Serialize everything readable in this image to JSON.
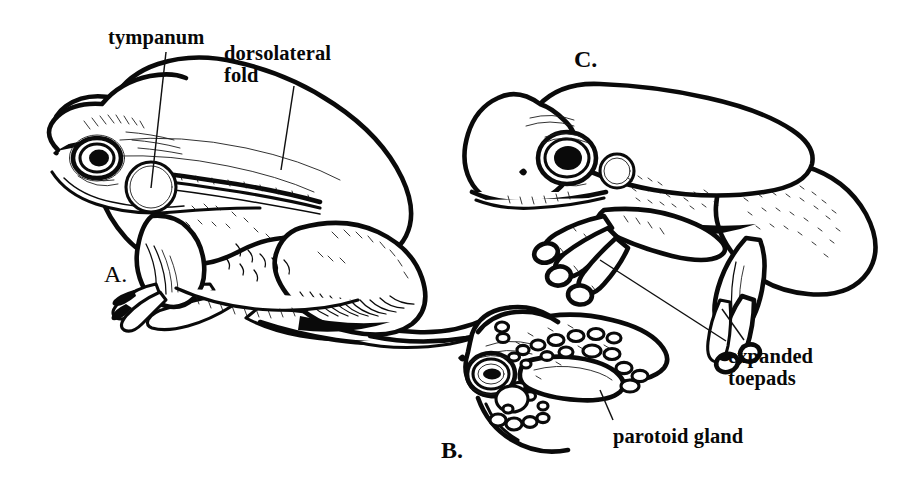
{
  "figure": {
    "background_color": "#ffffff",
    "ink_color": "#0a0a0a",
    "width": 908,
    "height": 499
  },
  "labels": {
    "tympanum": "tympanum",
    "dorsolateral_fold": "dorsolateral\nfold",
    "expanded_toepads": "expanded\ntoepads",
    "parotoid_gland": "parotoid gland"
  },
  "panels": {
    "a": "A.",
    "b": "B.",
    "c": "C."
  }
}
